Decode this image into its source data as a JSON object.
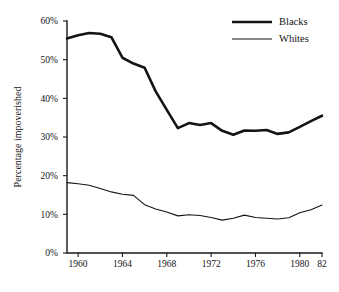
{
  "chart_data": {
    "type": "line",
    "title": "",
    "xlabel": "",
    "ylabel": "Percentage impoverished",
    "xlim": [
      1959,
      1982
    ],
    "ylim": [
      0,
      60
    ],
    "grid": false,
    "legend_position": "top-right",
    "x": [
      1959,
      1960,
      1961,
      1962,
      1963,
      1964,
      1965,
      1966,
      1967,
      1968,
      1969,
      1970,
      1971,
      1972,
      1973,
      1974,
      1975,
      1976,
      1977,
      1978,
      1979,
      1980,
      1981,
      1982
    ],
    "y_ticks": [
      0,
      10,
      20,
      30,
      40,
      50,
      60
    ],
    "y_tick_labels": [
      "0%",
      "10%",
      "20%",
      "30%",
      "40%",
      "50%",
      "60%"
    ],
    "x_ticks": [
      1960,
      1964,
      1968,
      1972,
      1976,
      1980,
      1982
    ],
    "x_tick_labels": [
      "1960",
      "1964",
      "1968",
      "1972",
      "1976",
      "1980",
      "82"
    ],
    "series": [
      {
        "name": "Blacks",
        "line_width": "thick",
        "color": "#141414",
        "values": [
          55.5,
          56.3,
          56.9,
          56.7,
          55.8,
          50.5,
          49.0,
          47.9,
          41.8,
          37.0,
          32.3,
          33.6,
          33.1,
          33.6,
          31.6,
          30.6,
          31.7,
          31.6,
          31.8,
          30.8,
          31.2,
          32.6,
          34.1,
          35.5
        ]
      },
      {
        "name": "Whites",
        "line_width": "thin",
        "color": "#141414",
        "values": [
          18.2,
          17.9,
          17.5,
          16.7,
          15.8,
          15.2,
          14.9,
          12.5,
          11.4,
          10.6,
          9.6,
          9.9,
          9.7,
          9.2,
          8.5,
          9.0,
          9.8,
          9.2,
          9.0,
          8.8,
          9.1,
          10.4,
          11.2,
          12.4
        ]
      }
    ]
  },
  "legend": {
    "entries": [
      {
        "label": "Blacks"
      },
      {
        "label": "Whites"
      }
    ]
  },
  "axes": {
    "y_title": "Percentage impoverished"
  }
}
